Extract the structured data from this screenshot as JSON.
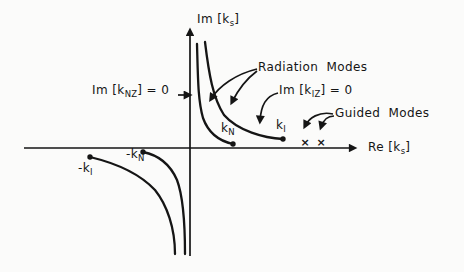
{
  "figure": {
    "background_color": "#fbfbfa",
    "ink_color": "#151515"
  },
  "axes": {
    "imaginary_axis_label": {
      "pre": "Im [k",
      "sub": "s",
      "post": "]"
    },
    "real_axis_label": {
      "pre": "Re [k",
      "sub": "s",
      "post": "]"
    }
  },
  "annotations": {
    "im_knz_zero": {
      "pre": "Im [k",
      "sub": "NZ",
      "post": "] = 0"
    },
    "im_kiz_zero": {
      "pre": "Im [k",
      "sub": "IZ",
      "post": "] = 0"
    },
    "radiation_modes": {
      "text": "Radiation Modes"
    },
    "guided_modes": {
      "text": "Guided Modes"
    }
  },
  "points": {
    "k_n": {
      "pre": "k",
      "sub": "N",
      "marker": "filled-dot"
    },
    "k_i": {
      "pre": "k",
      "sub": "I",
      "marker": "filled-dot"
    },
    "neg_k_n": {
      "pre": "-k",
      "sub": "N",
      "marker": "filled-dot"
    },
    "neg_k_i": {
      "pre": "-k",
      "sub": "I",
      "marker": "filled-dot"
    }
  },
  "markers": {
    "guided_mode_x": "×"
  }
}
